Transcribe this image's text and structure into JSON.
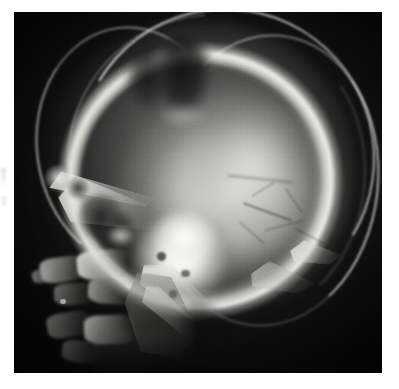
{
  "document": {
    "type": "medical-radiograph-figure",
    "background_color": "#ffffff",
    "figure_caption": ""
  },
  "figure": {
    "name": "lateral-skull-radiograph",
    "modality": "X-ray",
    "projection": "lateral",
    "body_region": "skull and upper cervical spine",
    "alt_text": "Lateral skull radiograph showing a well-defined lytic lesion in the parietal calvarium with a dense bright skull base and visible upper cervical vertebrae.",
    "frame": {
      "x": 14,
      "y": 12,
      "width": 368,
      "height": 361,
      "border_color": "#0a0a0a"
    },
    "colors": {
      "film_background": "#0b0b0b",
      "bone_bright": "#fffffc",
      "soft_tissue_mid": "#8a8a86",
      "lesion_dark": "#141414",
      "page_white": "#ffffff"
    },
    "labels": [],
    "annotations": [],
    "findings": [
      "lytic-lesion-parietal",
      "dense-skull-base",
      "vascular-markings-posterior-vault",
      "cervical-vertebrae-visible",
      "mandibular-ramus"
    ]
  },
  "regions": {
    "calvarium": "cranial vault",
    "lesion": "parietal lytic defect",
    "skull_base": "sella / petrous dense region",
    "orbit": "orbital roof and frontal sinus",
    "mandible": "mandibular ramus",
    "cervical_spine": "upper cervical vertebrae",
    "occiput": "occipital bone"
  }
}
